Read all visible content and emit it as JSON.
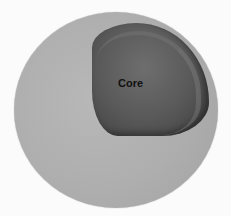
{
  "diagram": {
    "title": "",
    "labels": {
      "core": "Core"
    },
    "colors": {
      "background": "#fbfbfb",
      "outer_sphere": "#aeaeae",
      "cutaway": "#5a5a5a",
      "label": "#111111"
    }
  }
}
